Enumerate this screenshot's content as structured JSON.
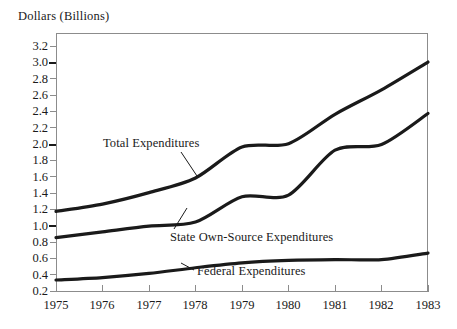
{
  "chart_data": {
    "type": "line",
    "title": "",
    "xlabel": "",
    "ylabel": "Dollars (Billions)",
    "x": [
      1975,
      1976,
      1977,
      1978,
      1979,
      1980,
      1981,
      1982,
      1983
    ],
    "xticklabels": [
      "1975",
      "1976",
      "1977",
      "1978",
      "1979",
      "1980",
      "1981",
      "1982",
      "1983"
    ],
    "yticklabels": [
      "3.2",
      "3.0",
      "2.8",
      "2.6",
      "2.4",
      "2.2",
      "2.0",
      "1.8",
      "1.6",
      "1.4",
      "1.2",
      "1.0",
      "0.8",
      "0.6",
      "0.4",
      "0.2"
    ],
    "ylim": [
      0.2,
      3.2
    ],
    "xlim": [
      1975,
      1983
    ],
    "ytick_step": 0.2,
    "grid": false,
    "legend_position": "inline-annotations",
    "series": [
      {
        "name": "Total Expenditures",
        "values": [
          1.17,
          1.26,
          1.4,
          1.58,
          1.96,
          2.0,
          2.36,
          2.66,
          3.0
        ],
        "color": "#1a1a1a"
      },
      {
        "name": "State Own-Source Expenditures",
        "values": [
          0.85,
          0.92,
          0.99,
          1.04,
          1.35,
          1.37,
          1.92,
          1.99,
          2.37
        ],
        "color": "#1a1a1a"
      },
      {
        "name": "Federal Expenditures",
        "values": [
          0.33,
          0.36,
          0.41,
          0.48,
          0.54,
          0.57,
          0.58,
          0.58,
          0.66
        ],
        "color": "#1a1a1a"
      }
    ],
    "annotations": [
      {
        "text": "Total Expenditures",
        "leader": true
      },
      {
        "text": "State Own-Source Expenditures",
        "leader": true
      },
      {
        "text": "Federal Expenditures",
        "leader": true
      }
    ]
  }
}
